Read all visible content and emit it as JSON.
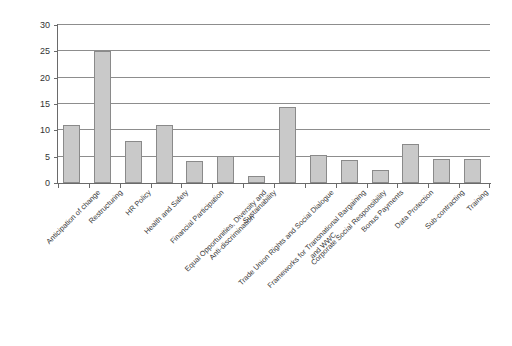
{
  "chart_data": {
    "type": "bar",
    "title": "",
    "subtitle": "",
    "xlabel": "",
    "ylabel": "",
    "ylim": [
      0,
      30
    ],
    "ytick_values": [
      0,
      5,
      10,
      15,
      20,
      25,
      30
    ],
    "ytick_labels": [
      "0",
      "5",
      "10",
      "15",
      "20",
      "25",
      "30"
    ],
    "grid": "horizontal",
    "legend": "none",
    "bar_fill_color": "#c9c9c9",
    "bar_border_color": "#8a8a8a",
    "axis_color": "#6a6a6a",
    "gridline_color": "#8d8d8d",
    "categories": [
      "Anticipation of change",
      "Restructuring",
      "HR Policy",
      "Health and Safety",
      "Financial Participation",
      "Equal Opportunities, Diversity and Anti-discrimination",
      "Sustainability",
      "Trade Union Rights and Social Dialogue",
      "Frameworks for Transnational Bargaining and WWC",
      "Corporate Social Responsibility",
      "Bonus Payments",
      "Data Protection",
      "Sub-contracting",
      "Training"
    ],
    "category_lines": [
      [
        "Anticipation of change"
      ],
      [
        "Restructuring"
      ],
      [
        "HR Policy"
      ],
      [
        "Health and Safety"
      ],
      [
        "Financial Participation"
      ],
      [
        "Equal Opportunities, Diversity and",
        "Anti-discrimination"
      ],
      [
        "Sustainability"
      ],
      [
        "Trade Union Rights and Social Dialogue"
      ],
      [
        "Frameworks for Transnational Bargaining",
        "and WWC"
      ],
      [
        "Corporate Social Responsibility"
      ],
      [
        "Bonus Payments"
      ],
      [
        "Data Protection"
      ],
      [
        "Sub-contracting"
      ],
      [
        "Training"
      ]
    ],
    "values": [
      11,
      25,
      8,
      11,
      4.2,
      5.2,
      1.3,
      14.5,
      5.3,
      4.4,
      2.4,
      7.5,
      4.5,
      4.6
    ]
  }
}
